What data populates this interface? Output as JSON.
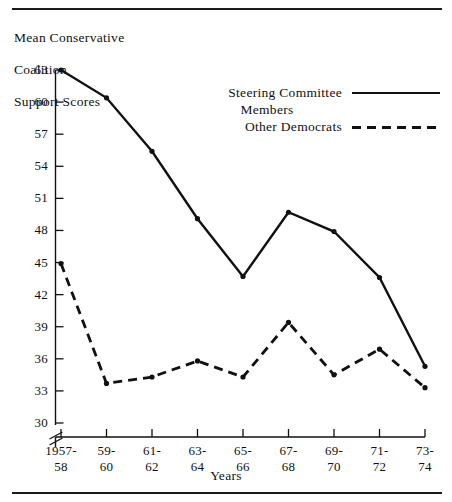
{
  "figure": {
    "y_axis_caption_lines": [
      "Mean Conservative",
      "Coalition",
      "Support Scores"
    ],
    "x_axis_title": "Years"
  },
  "legend": {
    "items": [
      {
        "label_line1": "Steering Committee",
        "label_line2": "Members",
        "style": "solid"
      },
      {
        "label_line1": "Other Democrats",
        "label_line2": "",
        "style": "dashed"
      }
    ]
  },
  "chart_data": {
    "type": "line",
    "title": "Mean Conservative Coalition Support Scores",
    "xlabel": "Years",
    "ylabel": "Mean Conservative Coalition Support Scores",
    "categories": [
      "1957-58",
      "59-60",
      "61-62",
      "63-64",
      "65-66",
      "67-68",
      "69-70",
      "71-72",
      "73-74"
    ],
    "xtick_lines": [
      [
        "1957-",
        "58"
      ],
      [
        "59-",
        "60"
      ],
      [
        "61-",
        "62"
      ],
      [
        "63-",
        "64"
      ],
      [
        "65-",
        "66"
      ],
      [
        "67-",
        "68"
      ],
      [
        "69-",
        "70"
      ],
      [
        "71-",
        "72"
      ],
      [
        "73-",
        "74"
      ]
    ],
    "ylim": [
      30,
      63
    ],
    "yticks": [
      30,
      33,
      36,
      39,
      42,
      45,
      48,
      51,
      54,
      57,
      60,
      63
    ],
    "y_axis_break": true,
    "grid": false,
    "legend_position": "upper-center-right",
    "series": [
      {
        "name": "Steering Committee Members",
        "style": "solid",
        "values": [
          63.0,
          60.4,
          55.4,
          49.1,
          43.7,
          49.7,
          47.9,
          43.6,
          35.3
        ]
      },
      {
        "name": "Other Democrats",
        "style": "dashed",
        "values": [
          44.9,
          33.7,
          34.3,
          35.8,
          34.3,
          39.4,
          34.5,
          36.9,
          33.3
        ]
      }
    ]
  },
  "colors": {
    "ink": "#111111",
    "paper": "#ffffff"
  }
}
